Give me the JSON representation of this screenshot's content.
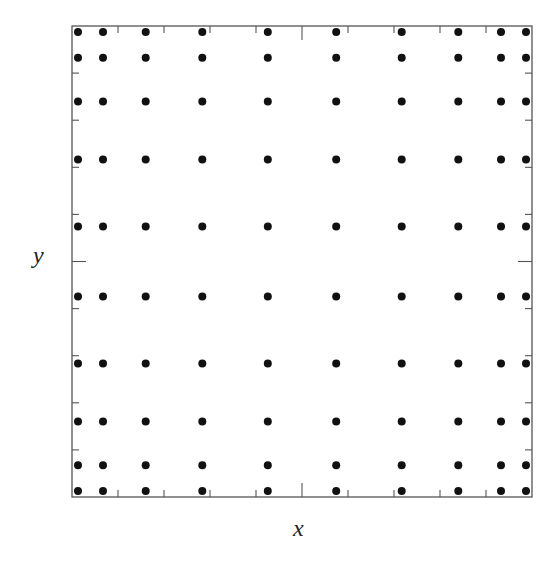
{
  "chart_data": {
    "type": "scatter",
    "title": "",
    "xlabel": "x",
    "ylabel": "y",
    "xlim": [
      -1,
      1
    ],
    "ylim": [
      -1,
      1
    ],
    "grid": false,
    "legend": null,
    "tick_labels": false,
    "x_ticks": [
      -0.8,
      -0.6,
      -0.4,
      -0.2,
      0,
      0.2,
      0.4,
      0.6,
      0.8
    ],
    "y_ticks": [
      -0.8,
      -0.6,
      -0.4,
      -0.2,
      0,
      0.2,
      0.4,
      0.6,
      0.8
    ],
    "x_nodes": [
      -0.9739,
      -0.8651,
      -0.6794,
      -0.4334,
      -0.1489,
      0.1489,
      0.4334,
      0.6794,
      0.8651,
      0.9739
    ],
    "y_nodes": [
      -0.9739,
      -0.8651,
      -0.6794,
      -0.4334,
      -0.1489,
      0.1489,
      0.4334,
      0.6794,
      0.8651,
      0.9739
    ],
    "point_count": 100,
    "marker": {
      "shape": "circle",
      "color": "#111111",
      "radius": 4
    }
  },
  "labels": {
    "x": "x",
    "y": "y"
  },
  "frame": {
    "left": 72,
    "top": 26,
    "right": 532,
    "bottom": 497,
    "color": "#555555"
  }
}
